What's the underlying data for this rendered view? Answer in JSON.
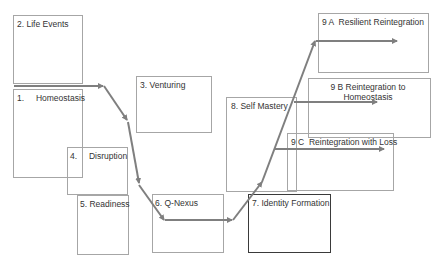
{
  "diagram": {
    "colors": {
      "arrow": "#7f7f7f",
      "box_border": "#a6a6a6",
      "highlight_border": "#3a3a3a",
      "text": "#333333"
    },
    "nodes": [
      {
        "id": "life-events",
        "label": "2. Life Events"
      },
      {
        "id": "homeostasis",
        "label": "1.     Homeostasis"
      },
      {
        "id": "venturing",
        "label": "3. Venturing"
      },
      {
        "id": "disruption",
        "label": "4.     Disruption"
      },
      {
        "id": "readiness",
        "label": "5. Readiness"
      },
      {
        "id": "q-nexus",
        "label": "6. Q-Nexus"
      },
      {
        "id": "identity-formation",
        "label": "7. Identity Formation"
      },
      {
        "id": "self-mastery",
        "label": "8. Self Mastery"
      },
      {
        "id": "resilient-reintegration",
        "label": "9 A  Resilient Reintegration"
      },
      {
        "id": "reintegration-homeostasis",
        "label": "9 B  Reintegration to Homeostasis"
      },
      {
        "id": "reintegration-loss",
        "label": "9 C  Reintegration with Loss"
      }
    ],
    "path": [
      "Homeostasis",
      "Disruption",
      "Readiness",
      "Q-Nexus",
      "Identity Formation",
      "Self Mastery",
      "Resilient Reintegration / Reintegration to Homeostasis / Reintegration with Loss"
    ]
  }
}
